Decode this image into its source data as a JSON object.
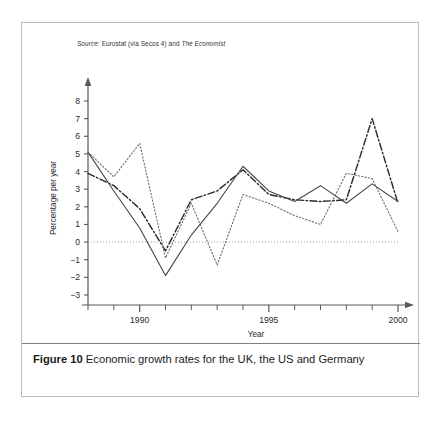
{
  "figure": {
    "source_note": {
      "prefix": "Source:",
      "body": "Eurostat (via Secos 4) and",
      "italic_tail": "The Economist"
    },
    "caption": {
      "label": "Figure 10",
      "text": "Economic growth rates for the UK, the US and Germany"
    }
  },
  "chart_data": {
    "type": "line",
    "title": "",
    "subtitle": "",
    "xlabel": "Year",
    "ylabel": "Percentage per year",
    "x": [
      1988,
      1989,
      1990,
      1991,
      1992,
      1993,
      1994,
      1995,
      1996,
      1997,
      1998,
      1999,
      2000
    ],
    "xlim": [
      1988,
      2000
    ],
    "ylim": [
      -3,
      8
    ],
    "x_tick_labels": [
      "1990",
      "1995",
      "2000"
    ],
    "x_tick_values": [
      1990,
      1995,
      2000
    ],
    "y_tick_labels": [
      "8",
      "7",
      "6",
      "5",
      "4",
      "3",
      "2",
      "1",
      "0",
      "−1",
      "−2",
      "−3"
    ],
    "y_tick_values": [
      8,
      7,
      6,
      5,
      4,
      3,
      2,
      1,
      0,
      -1,
      -2,
      -3
    ],
    "grid": false,
    "zero_line": true,
    "legend_position": "bottom-right",
    "series": [
      {
        "name": "USA",
        "style": "dash-dot",
        "color": "#2b2b2b",
        "values": [
          3.9,
          3.2,
          1.9,
          -0.5,
          2.4,
          2.9,
          4.1,
          2.7,
          2.4,
          2.3,
          2.4,
          7.0,
          2.2
        ]
      },
      {
        "name": "UK",
        "style": "solid",
        "color": "#4a4a4a",
        "values": [
          5.1,
          2.9,
          0.8,
          -1.9,
          0.4,
          2.2,
          4.3,
          2.9,
          2.3,
          3.2,
          2.2,
          3.3,
          2.3
        ]
      },
      {
        "name": "Germany",
        "style": "dotted",
        "color": "#6a6a6a",
        "values": [
          5.1,
          3.7,
          5.6,
          -0.9,
          2.2,
          -1.3,
          2.7,
          2.2,
          1.5,
          1.0,
          3.9,
          3.6,
          0.6
        ]
      }
    ]
  }
}
